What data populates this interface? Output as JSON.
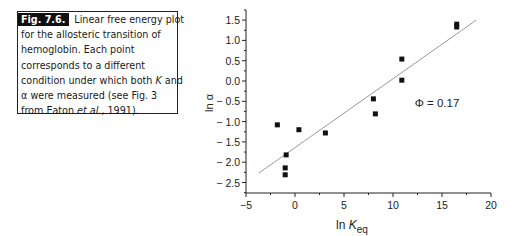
{
  "caption": {
    "fig_label": "Fig. 7.6.",
    "lines": [
      "Linear free energy plot",
      "for the allosteric transition of",
      "hemoglobin. Each point",
      "corresponds to a different",
      "condition under which both",
      "were measured (see Fig. 3",
      "from Eaton"
    ],
    "k_symbol": "K",
    "and_word": "and",
    "alpha_symbol": "α",
    "et_al": "et al.",
    "year_suffix": ", 1991)."
  },
  "chart_data": {
    "type": "scatter",
    "title": "",
    "xlabel": "ln K_eq",
    "xlabel_main": "ln K",
    "xlabel_sub": "eq",
    "ylabel": "ln α",
    "xlim": [
      -5,
      20
    ],
    "ylim": [
      -2.75,
      1.75
    ],
    "xticks": [
      -5,
      0,
      5,
      10,
      15,
      20
    ],
    "xtick_labels": [
      "−5",
      "0",
      "5",
      "10",
      "15",
      "20"
    ],
    "yticks": [
      1.5,
      1.0,
      0.5,
      0.0,
      -0.5,
      -1.0,
      -1.5,
      -2.0,
      -2.5
    ],
    "ytick_labels": [
      "1.5",
      "1.0",
      "0.5",
      "0.0",
      "− 0.5",
      "− 1.0",
      "− 1.5",
      "− 2.0",
      "− 2.5"
    ],
    "grid": false,
    "points": [
      {
        "x": -1.8,
        "y": -1.08
      },
      {
        "x": 0.4,
        "y": -1.2
      },
      {
        "x": 3.1,
        "y": -1.28
      },
      {
        "x": -0.9,
        "y": -1.82
      },
      {
        "x": -1.0,
        "y": -2.14
      },
      {
        "x": -1.0,
        "y": -2.31
      },
      {
        "x": 8.0,
        "y": -0.44
      },
      {
        "x": 8.2,
        "y": -0.81
      },
      {
        "x": 10.9,
        "y": 0.54
      },
      {
        "x": 10.9,
        "y": 0.02
      },
      {
        "x": 16.5,
        "y": 1.4
      },
      {
        "x": 16.5,
        "y": 1.33
      }
    ],
    "fit_line": {
      "x1": -3.7,
      "y1": -2.27,
      "x2": 18.5,
      "y2": 1.5
    },
    "annotation": "Φ = 0.17"
  }
}
